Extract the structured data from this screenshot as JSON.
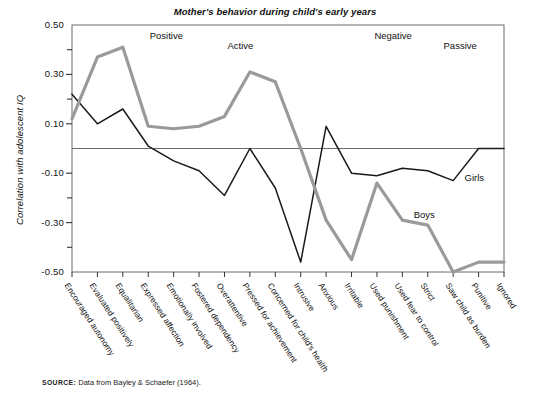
{
  "chart_data": {
    "type": "line",
    "title": "Mother's behavior during child's early years",
    "xlabel": "",
    "ylabel": "Correlation with adolescent IQ",
    "ylim": [
      -0.5,
      0.5
    ],
    "ytick_labels": [
      "0.50",
      "0.30",
      "0.10",
      "-0.10",
      "-0.30",
      "-0.50"
    ],
    "ytick_values": [
      0.5,
      0.3,
      0.1,
      -0.1,
      -0.3,
      -0.5
    ],
    "minor_tick_values": [
      0.4,
      0.2,
      -0.2,
      -0.4
    ],
    "grid": false,
    "zero_line": true,
    "legend_position": "inline-annotation",
    "categories": [
      "Encouraged autonomy",
      "Evaluated positively",
      "Equalitarian",
      "Expressed affection",
      "Emotionally involved",
      "Fostered dependency",
      "Overattentive",
      "Pressed for achievement",
      "Concerned for child's health",
      "Intrusive",
      "Anxious",
      "Irritable",
      "Used punishment",
      "Used fear to control",
      "Strict",
      "Saw child as burden",
      "Punitive",
      "Ignored"
    ],
    "series": [
      {
        "name": "Girls",
        "color": "#1a1a1a",
        "values": [
          0.22,
          0.1,
          0.16,
          0.01,
          -0.05,
          -0.09,
          -0.19,
          0.0,
          -0.16,
          -0.46,
          0.09,
          -0.1,
          -0.11,
          -0.08,
          -0.09,
          -0.13,
          0.0,
          0.0
        ]
      },
      {
        "name": "Boys",
        "color": "#9a9a9a",
        "values": [
          0.12,
          0.37,
          0.41,
          0.09,
          0.08,
          0.09,
          0.13,
          0.31,
          0.27,
          0.0,
          -0.29,
          -0.45,
          -0.14,
          -0.29,
          -0.31,
          -0.5,
          -0.46,
          -0.46
        ]
      }
    ],
    "region_labels": [
      {
        "text": "Positive",
        "x": 0.18,
        "y": 0.455
      },
      {
        "text": "Active",
        "x": 0.36,
        "y": 0.415
      },
      {
        "text": "Negative",
        "x": 0.7,
        "y": 0.455
      },
      {
        "text": "Passive",
        "x": 0.86,
        "y": 0.415
      }
    ],
    "series_annotations": [
      {
        "text": "Girls",
        "series": "Girls",
        "x_index": 16,
        "y": -0.12
      },
      {
        "text": "Boys",
        "series": "Boys",
        "x_index": 14,
        "y": -0.27
      }
    ]
  },
  "source": {
    "prefix": "SOURCE:",
    "text": "Data from Bayley & Schaefer (1964)."
  }
}
